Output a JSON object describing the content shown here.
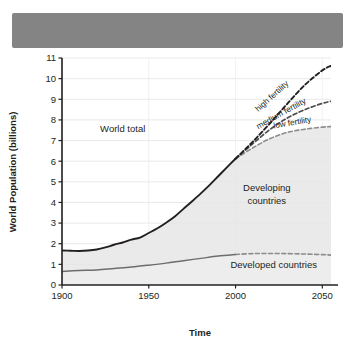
{
  "figure": {
    "title_bar": {
      "name": "redacted-title-bar",
      "text": "",
      "color": "#848484"
    }
  },
  "chart_data": {
    "type": "line",
    "title": "",
    "xlabel": "Time",
    "ylabel": "World Population (billions)",
    "xlim": [
      1900,
      2055
    ],
    "ylim": [
      0,
      11
    ],
    "xticks": [
      1900,
      1950,
      2000,
      2050
    ],
    "xticklabels": [
      "1900",
      "1950",
      "2000",
      "2050"
    ],
    "yticks": [
      0,
      1,
      2,
      3,
      4,
      5,
      6,
      7,
      8,
      9,
      10,
      11
    ],
    "yticklabels": [
      "0",
      "1",
      "2",
      "3",
      "4",
      "5",
      "6",
      "7",
      "8",
      "9",
      "10",
      "11"
    ],
    "grid": true,
    "grid_axis": "y",
    "legend": "none (inline annotations)",
    "annotations": [
      {
        "text": "World total",
        "x": 1935,
        "y": 7.4,
        "rotation": 0
      },
      {
        "text": "Developing",
        "x": 2018,
        "y": 4.55,
        "rotation": 0
      },
      {
        "text": "countries",
        "x": 2018,
        "y": 3.95,
        "rotation": 0
      },
      {
        "text": "Developed countries",
        "x": 2022,
        "y": 0.85,
        "rotation": 0
      },
      {
        "text": "high fertility",
        "x": 2022,
        "y": 9.05,
        "rotation": -42
      },
      {
        "text": "medium fertility",
        "x": 2027,
        "y": 8.2,
        "rotation": -29
      },
      {
        "text": "low fertility",
        "x": 2033,
        "y": 7.75,
        "rotation": -10
      }
    ],
    "series": [
      {
        "name": "World total (historical)",
        "style": "solid",
        "color": "#231f20",
        "x": [
          1900,
          1905,
          1910,
          1915,
          1920,
          1925,
          1930,
          1935,
          1940,
          1945,
          1950,
          1955,
          1960,
          1965,
          1970,
          1975,
          1980,
          1985,
          1990,
          1995,
          2000
        ],
        "y": [
          1.67,
          1.66,
          1.65,
          1.67,
          1.72,
          1.82,
          1.95,
          2.06,
          2.2,
          2.3,
          2.52,
          2.75,
          3.02,
          3.32,
          3.69,
          4.06,
          4.44,
          4.84,
          5.27,
          5.7,
          6.12
        ]
      },
      {
        "name": "high fertility",
        "style": "dashed",
        "color": "#231f20",
        "x": [
          2000,
          2010,
          2020,
          2030,
          2040,
          2050,
          2055
        ],
        "y": [
          6.12,
          6.95,
          7.85,
          8.8,
          9.7,
          10.4,
          10.62
        ]
      },
      {
        "name": "medium fertility",
        "style": "dashed",
        "color": "#4d4d4d",
        "x": [
          2000,
          2010,
          2020,
          2030,
          2040,
          2050,
          2055
        ],
        "y": [
          6.12,
          6.85,
          7.55,
          8.1,
          8.5,
          8.8,
          8.9
        ]
      },
      {
        "name": "low fertility",
        "style": "dashed",
        "color": "#8c8c8c",
        "x": [
          2000,
          2010,
          2020,
          2030,
          2040,
          2050,
          2055
        ],
        "y": [
          6.12,
          6.65,
          7.1,
          7.4,
          7.55,
          7.65,
          7.68
        ]
      },
      {
        "name": "Developed countries (historical)",
        "style": "solid",
        "color": "#6d6d6d",
        "x": [
          1900,
          1910,
          1920,
          1930,
          1940,
          1950,
          1960,
          1970,
          1980,
          1990,
          2000
        ],
        "y": [
          0.66,
          0.7,
          0.73,
          0.8,
          0.87,
          0.96,
          1.06,
          1.18,
          1.29,
          1.4,
          1.48
        ]
      },
      {
        "name": "Developed countries (projection)",
        "style": "dashed",
        "color": "#8c8c8c",
        "x": [
          2000,
          2010,
          2020,
          2030,
          2040,
          2050,
          2055
        ],
        "y": [
          1.48,
          1.52,
          1.53,
          1.52,
          1.5,
          1.47,
          1.45
        ]
      }
    ],
    "bands": [
      {
        "name": "Developed countries band",
        "description": "light grey shaded area from 0 to developed countries curve"
      },
      {
        "name": "Developing countries band",
        "description": "light grey shaded area between developed countries curve and world total / low fertility curve"
      }
    ]
  }
}
